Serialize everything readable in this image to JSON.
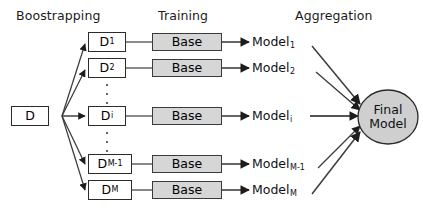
{
  "diagram": {
    "colors": {
      "box_fill": "#ffffff",
      "gray_fill": "#d6d6d6",
      "stroke": "#2b2b2b",
      "text": "#111111"
    },
    "headers": [
      {
        "name": "bootstrapping",
        "label": "Boostrapping"
      },
      {
        "name": "training",
        "label": "Training"
      },
      {
        "name": "aggregation",
        "label": "Aggregation"
      }
    ],
    "source": {
      "label": "D"
    },
    "rows": [
      {
        "dataset_label": "D",
        "dataset_sub": "1",
        "learner_label": "Base",
        "model_label": "Model",
        "model_sub": "1"
      },
      {
        "dataset_label": "D",
        "dataset_sub": "2",
        "learner_label": "Base",
        "model_label": "Model",
        "model_sub": "2"
      },
      {
        "dataset_label": "D",
        "dataset_sub": "i",
        "learner_label": "Base",
        "model_label": "Model",
        "model_sub": "i"
      },
      {
        "dataset_label": "D",
        "dataset_sub": "M-1",
        "learner_label": "Base",
        "model_label": "Model",
        "model_sub": "M-1"
      },
      {
        "dataset_label": "D",
        "dataset_sub": "M",
        "learner_label": "Base",
        "model_label": "Model",
        "model_sub": "M"
      }
    ],
    "final": {
      "line1": "Final",
      "line2": "Model"
    },
    "ellipsis": {
      "glyph": "vertical-ellipsis",
      "count": 2
    }
  }
}
